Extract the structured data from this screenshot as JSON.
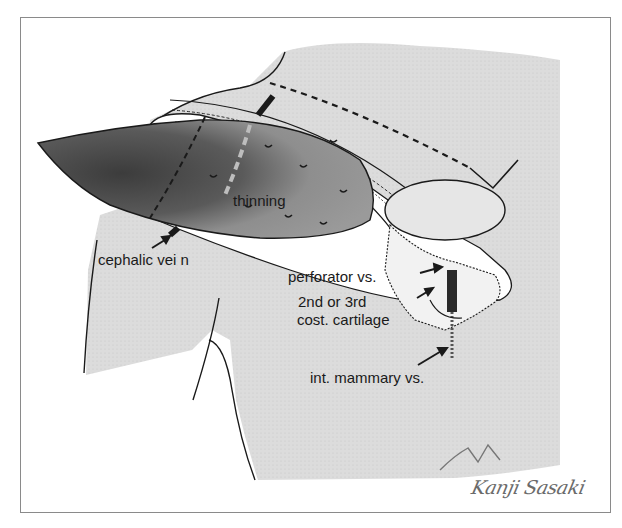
{
  "figure": {
    "colors": {
      "frame_border": "#8a8a8a",
      "skin_shade": "#d9d9d9",
      "flap_dark": "#4a4a4a",
      "flap_mid": "#8c8c8c",
      "outline": "#1a1a1a",
      "signature": "#6b6b6b"
    },
    "labels": {
      "thinning": "thinning",
      "cephalic_vein": "cephalic vei n",
      "perforator": "perforator vs.",
      "rib_level_line1": "2nd or 3rd",
      "rib_level_line2": "cost. cartilage",
      "internal_mammary": "int. mammary vs."
    },
    "signature": "Kanji Sasaki"
  }
}
